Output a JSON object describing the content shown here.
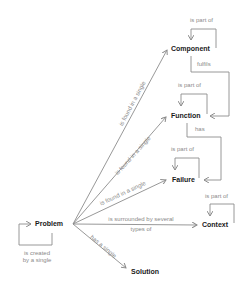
{
  "diagram": {
    "nodes": {
      "component": "Component",
      "function": "Function",
      "failure": "Failure",
      "context": "Context",
      "problem": "Problem",
      "solution": "Solution"
    },
    "edges": {
      "component_self": "is part of",
      "function_self": "is part of",
      "failure_self": "is part of",
      "context_self": "is part of",
      "problem_self_1": "is created",
      "problem_self_2": "by a single",
      "component_function": "fulfils",
      "function_failure": "has",
      "problem_component": "is found in a single",
      "problem_function": "is found in a single",
      "problem_failure": "is found in a single",
      "problem_context_1": "is surrounded by several",
      "problem_context_2": "types of",
      "problem_solution": "has a single"
    },
    "colors": {
      "line": "#8c8c8c",
      "node_text": "#1a1a1a",
      "label_text": "#8a8a8a"
    }
  }
}
